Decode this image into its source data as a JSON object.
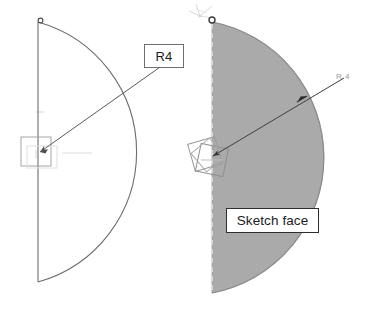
{
  "scene": {
    "title": "Sketch arc radius dimension and shaded sketch face",
    "background_color": "#ffffff"
  },
  "colors": {
    "outline": "#6d6d6d",
    "leader": "#5a5a5a",
    "shaded_face_fill": "#aaaaaa",
    "shaded_face_edge": "#8c8c8c",
    "dashed_edge": "#d8d8d8",
    "callout_border_light": "#6d6d6d",
    "callout_border_dark": "#2d2d2d",
    "callout_text": "#1b1b1b",
    "faint_gray": "#c9c9c9",
    "origin_marker": "#4a4a4a",
    "triad_glyph": "#8f8f8f"
  },
  "left_figure": {
    "name": "wireframe-semicircle-sketch",
    "radius_callout": {
      "text": "R4",
      "boxed": true
    },
    "origin_marker": {
      "name": "arc-start-point",
      "shape": "circle"
    },
    "center_handle": {
      "name": "arc-center-selection-box",
      "shape": "square"
    },
    "geometry": {
      "center_x": 38,
      "center_y": 153,
      "radius": 135,
      "arc_top_y": 22,
      "arc_bottom_y": 282,
      "leader_tip_x": 133,
      "leader_tip_y": 88
    }
  },
  "right_figure": {
    "name": "shaded-semicircle-face",
    "radius_callout": {
      "text": "R 4",
      "boxed": false
    },
    "face_callout": {
      "text": "Sketch face",
      "boxed": true
    },
    "origin_marker": {
      "name": "face-origin-point",
      "shape": "dot"
    },
    "axis_glyph": {
      "name": "coordinate-triad-icon"
    },
    "center_handle": {
      "name": "face-center-rotate-handle",
      "shape": "rotated-squares"
    },
    "geometry": {
      "center_x": 212,
      "center_y": 155,
      "radius": 138,
      "arc_top_y": 22,
      "arc_bottom_y": 293,
      "leader_tip_x": 307,
      "leader_tip_y": 96
    }
  }
}
